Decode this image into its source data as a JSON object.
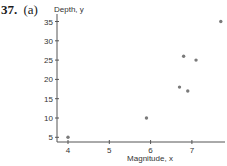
{
  "header": {
    "problem_number": "37.",
    "part_label": "(a)"
  },
  "colors": {
    "axis": "#555555",
    "point": "#7a7a7a",
    "text": "#333333"
  },
  "chart_data": {
    "type": "scatter",
    "title": "",
    "xlabel": "Magnitude, x",
    "ylabel": "Depth, y",
    "xlim": [
      3.73,
      7.85
    ],
    "ylim": [
      4,
      37
    ],
    "x_ticks": [
      4,
      5,
      6,
      7
    ],
    "y_ticks": [
      5,
      10,
      15,
      20,
      25,
      30,
      35
    ],
    "grid": false,
    "legend": null,
    "series": [
      {
        "name": "Earthquakes",
        "points": [
          {
            "x": 4.0,
            "y": 5
          },
          {
            "x": 5.9,
            "y": 10
          },
          {
            "x": 6.7,
            "y": 18
          },
          {
            "x": 6.8,
            "y": 26
          },
          {
            "x": 6.9,
            "y": 17
          },
          {
            "x": 7.1,
            "y": 25
          },
          {
            "x": 7.7,
            "y": 35
          }
        ]
      }
    ]
  }
}
